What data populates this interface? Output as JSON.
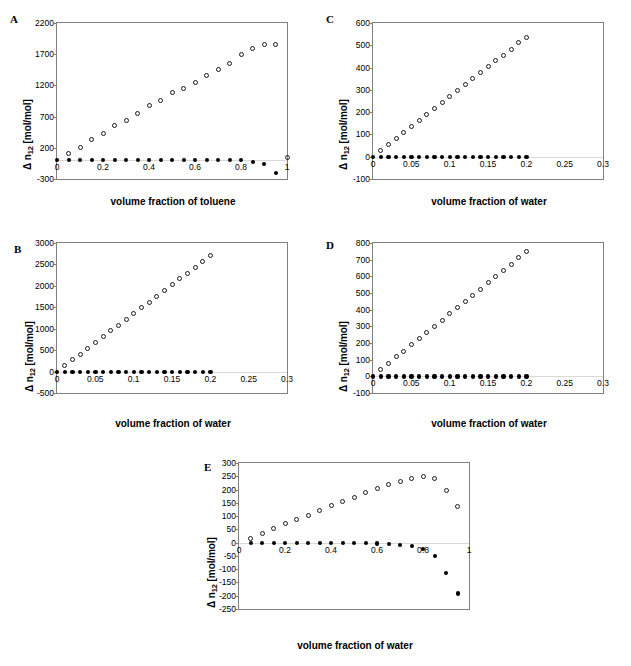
{
  "figure": {
    "background": "#ffffff",
    "marker_colors": {
      "open": "#1a1a1a",
      "filled": "#000000"
    },
    "axis_color": "#808080"
  },
  "chart_data": [
    {
      "id": "A",
      "type": "scatter",
      "panel_label": "A",
      "title": "",
      "xlabel": "volume fraction of toluene",
      "ylabel": "Δ n12 [mol/mol]",
      "ylabel_parts": {
        "delta": "Δ",
        "n": " n",
        "sub": "12",
        "unit": " [mol/mol]"
      },
      "xlim": [
        0,
        1
      ],
      "ylim": [
        -300,
        2200
      ],
      "xticks": [
        0,
        0.2,
        0.4,
        0.6,
        0.8,
        1
      ],
      "xticklabels": [
        "0",
        "0.2",
        "0.4",
        "0.6",
        "0.8",
        "1"
      ],
      "yticks": [
        -300,
        200,
        700,
        1200,
        1700,
        2200
      ],
      "yticklabels": [
        "-300",
        "200",
        "700",
        "1200",
        "1700",
        "2200"
      ],
      "grid": false,
      "legend": "none",
      "series": [
        {
          "name": "open-circles",
          "marker": "open",
          "x": [
            0.05,
            0.1,
            0.15,
            0.2,
            0.25,
            0.3,
            0.35,
            0.4,
            0.45,
            0.5,
            0.55,
            0.6,
            0.65,
            0.7,
            0.75,
            0.8,
            0.85,
            0.9,
            0.95,
            1.0
          ],
          "y": [
            110,
            210,
            330,
            430,
            560,
            640,
            750,
            880,
            960,
            1080,
            1150,
            1250,
            1360,
            1450,
            1550,
            1690,
            1790,
            1860,
            1850,
            40
          ]
        },
        {
          "name": "filled-circles",
          "marker": "filled",
          "x": [
            0.0,
            0.05,
            0.1,
            0.15,
            0.2,
            0.25,
            0.3,
            0.35,
            0.4,
            0.45,
            0.5,
            0.55,
            0.6,
            0.65,
            0.7,
            0.75,
            0.8,
            0.85,
            0.9,
            0.95
          ],
          "y": [
            10,
            10,
            10,
            10,
            10,
            10,
            10,
            10,
            10,
            10,
            10,
            10,
            10,
            10,
            10,
            5,
            0,
            -20,
            -60,
            -200
          ]
        }
      ]
    },
    {
      "id": "B",
      "type": "scatter",
      "panel_label": "B",
      "title": "",
      "xlabel": "volume fraction of water",
      "ylabel": "Δ n12 [mol/mol]",
      "ylabel_parts": {
        "delta": "Δ",
        "n": " n",
        "sub": "12",
        "unit": " [mol/mol]"
      },
      "xlim": [
        0,
        0.3
      ],
      "ylim": [
        -500,
        3000
      ],
      "xticks": [
        0,
        0.05,
        0.1,
        0.15,
        0.2,
        0.25,
        0.3
      ],
      "xticklabels": [
        "0",
        "0.05",
        "0.1",
        "0.15",
        "0.2",
        "0.25",
        "0.3"
      ],
      "yticks": [
        -500,
        0,
        500,
        1000,
        1500,
        2000,
        2500,
        3000
      ],
      "yticklabels": [
        "-500",
        "0",
        "500",
        "1000",
        "1500",
        "2000",
        "2500",
        "3000"
      ],
      "grid": false,
      "legend": "none",
      "series": [
        {
          "name": "open-circles",
          "marker": "open",
          "x": [
            0.01,
            0.02,
            0.03,
            0.04,
            0.05,
            0.06,
            0.07,
            0.08,
            0.09,
            0.1,
            0.11,
            0.12,
            0.13,
            0.14,
            0.15,
            0.16,
            0.17,
            0.18,
            0.19,
            0.2
          ],
          "y": [
            150,
            280,
            410,
            540,
            670,
            810,
            950,
            1080,
            1220,
            1350,
            1490,
            1620,
            1760,
            1900,
            2040,
            2170,
            2300,
            2440,
            2570,
            2700
          ]
        },
        {
          "name": "filled-circles",
          "marker": "filled",
          "x": [
            0.0,
            0.01,
            0.02,
            0.03,
            0.04,
            0.05,
            0.06,
            0.07,
            0.08,
            0.09,
            0.1,
            0.11,
            0.12,
            0.13,
            0.14,
            0.15,
            0.16,
            0.17,
            0.18,
            0.19,
            0.2
          ],
          "y": [
            0,
            0,
            0,
            0,
            0,
            0,
            0,
            0,
            0,
            0,
            0,
            0,
            0,
            0,
            0,
            0,
            0,
            0,
            0,
            0,
            0
          ]
        }
      ]
    },
    {
      "id": "C",
      "type": "scatter",
      "panel_label": "C",
      "title": "",
      "xlabel": "volume fraction of water",
      "ylabel": "Δ n12 [mol/mol]",
      "ylabel_parts": {
        "delta": "Δ",
        "n": " n",
        "sub": "12",
        "unit": " [mol/mol]"
      },
      "xlim": [
        0,
        0.3
      ],
      "ylim": [
        -100,
        600
      ],
      "xticks": [
        0,
        0.05,
        0.1,
        0.15,
        0.2,
        0.25,
        0.3
      ],
      "xticklabels": [
        "0",
        "0.05",
        "0.1",
        "0.15",
        "0.2",
        "0.25",
        "0.3"
      ],
      "yticks": [
        -100,
        0,
        100,
        200,
        300,
        400,
        500,
        600
      ],
      "yticklabels": [
        "-100",
        "0",
        "100",
        "200",
        "300",
        "400",
        "500",
        "600"
      ],
      "grid": false,
      "legend": "none",
      "series": [
        {
          "name": "open-circles",
          "marker": "open",
          "x": [
            0.01,
            0.02,
            0.03,
            0.04,
            0.05,
            0.06,
            0.07,
            0.08,
            0.09,
            0.1,
            0.11,
            0.12,
            0.13,
            0.14,
            0.15,
            0.16,
            0.17,
            0.18,
            0.19,
            0.2
          ],
          "y": [
            28,
            55,
            83,
            110,
            136,
            161,
            189,
            216,
            243,
            270,
            297,
            323,
            349,
            376,
            403,
            430,
            456,
            483,
            511,
            537
          ]
        },
        {
          "name": "filled-circles",
          "marker": "filled",
          "x": [
            0.0,
            0.01,
            0.02,
            0.03,
            0.04,
            0.05,
            0.06,
            0.07,
            0.08,
            0.09,
            0.1,
            0.11,
            0.12,
            0.13,
            0.14,
            0.15,
            0.16,
            0.17,
            0.18,
            0.19,
            0.2
          ],
          "y": [
            0,
            0,
            0,
            0,
            0,
            0,
            0,
            0,
            0,
            0,
            0,
            0,
            0,
            0,
            0,
            0,
            0,
            0,
            0,
            0,
            0
          ]
        }
      ]
    },
    {
      "id": "D",
      "type": "scatter",
      "panel_label": "D",
      "title": "",
      "xlabel": "volume fraction of water",
      "ylabel": "Δ n12 [mol/mol]",
      "ylabel_parts": {
        "delta": "Δ",
        "n": " n",
        "sub": "12",
        "unit": " [mol/mol]"
      },
      "xlim": [
        0,
        0.3
      ],
      "ylim": [
        -100,
        800
      ],
      "xticks": [
        0,
        0.05,
        0.1,
        0.15,
        0.2,
        0.25,
        0.3
      ],
      "xticklabels": [
        "0",
        "0.05",
        "0.1",
        "0.15",
        "0.2",
        "0.25",
        "0.3"
      ],
      "yticks": [
        -100,
        0,
        100,
        200,
        300,
        400,
        500,
        600,
        700,
        800
      ],
      "yticklabels": [
        "-100",
        "0",
        "100",
        "200",
        "300",
        "400",
        "500",
        "600",
        "700",
        "800"
      ],
      "grid": false,
      "legend": "none",
      "series": [
        {
          "name": "open-circles",
          "marker": "open",
          "x": [
            0.01,
            0.02,
            0.03,
            0.04,
            0.05,
            0.06,
            0.07,
            0.08,
            0.09,
            0.1,
            0.11,
            0.12,
            0.13,
            0.14,
            0.15,
            0.16,
            0.17,
            0.18,
            0.19,
            0.2
          ],
          "y": [
            40,
            79,
            117,
            152,
            190,
            227,
            264,
            301,
            338,
            375,
            412,
            450,
            487,
            524,
            561,
            598,
            636,
            673,
            711,
            748
          ]
        },
        {
          "name": "filled-circles",
          "marker": "filled",
          "x": [
            0.0,
            0.01,
            0.02,
            0.03,
            0.04,
            0.05,
            0.06,
            0.07,
            0.08,
            0.09,
            0.1,
            0.11,
            0.12,
            0.13,
            0.14,
            0.15,
            0.16,
            0.17,
            0.18,
            0.19,
            0.2
          ],
          "y": [
            0,
            0,
            0,
            0,
            0,
            0,
            0,
            0,
            0,
            0,
            0,
            0,
            0,
            0,
            0,
            0,
            0,
            0,
            0,
            0,
            0
          ]
        }
      ]
    },
    {
      "id": "E",
      "type": "scatter",
      "panel_label": "E",
      "title": "",
      "xlabel": "volume fraction of water",
      "ylabel": "Δ n12 [mol/mol]",
      "ylabel_parts": {
        "delta": "Δ",
        "n": " n",
        "sub": "12",
        "unit": " [mol/mol]"
      },
      "xlim": [
        0,
        1
      ],
      "ylim": [
        -250,
        300
      ],
      "xticks": [
        0,
        0.2,
        0.4,
        0.6,
        0.8,
        1
      ],
      "xticklabels": [
        "0",
        "0.2",
        "0.4",
        "0.6",
        "0.8",
        "1"
      ],
      "yticks": [
        -250,
        -200,
        -150,
        -100,
        -50,
        0,
        50,
        100,
        150,
        200,
        250,
        300
      ],
      "yticklabels": [
        "-250",
        "-200",
        "-150",
        "-100",
        "-50",
        "0",
        "50",
        "100",
        "150",
        "200",
        "250",
        "300"
      ],
      "grid": false,
      "legend": "none",
      "series": [
        {
          "name": "open-circles",
          "marker": "open",
          "x": [
            0.05,
            0.1,
            0.15,
            0.2,
            0.25,
            0.3,
            0.35,
            0.4,
            0.45,
            0.5,
            0.55,
            0.6,
            0.65,
            0.7,
            0.75,
            0.8,
            0.85,
            0.9,
            0.95
          ],
          "y": [
            17,
            36,
            55,
            71,
            87,
            104,
            122,
            139,
            155,
            170,
            187,
            204,
            218,
            232,
            243,
            249,
            241,
            196,
            136
          ]
        },
        {
          "name": "filled-circles",
          "marker": "filled",
          "x": [
            0.05,
            0.1,
            0.15,
            0.2,
            0.25,
            0.3,
            0.35,
            0.4,
            0.45,
            0.5,
            0.55,
            0.6,
            0.65,
            0.7,
            0.75,
            0.8,
            0.85,
            0.9,
            0.95
          ],
          "y": [
            0,
            0,
            0,
            0,
            0,
            0,
            0,
            0,
            -1,
            -1,
            -2,
            -3,
            -5,
            -8,
            -12,
            -24,
            -51,
            -114,
            -191
          ]
        }
      ]
    }
  ]
}
